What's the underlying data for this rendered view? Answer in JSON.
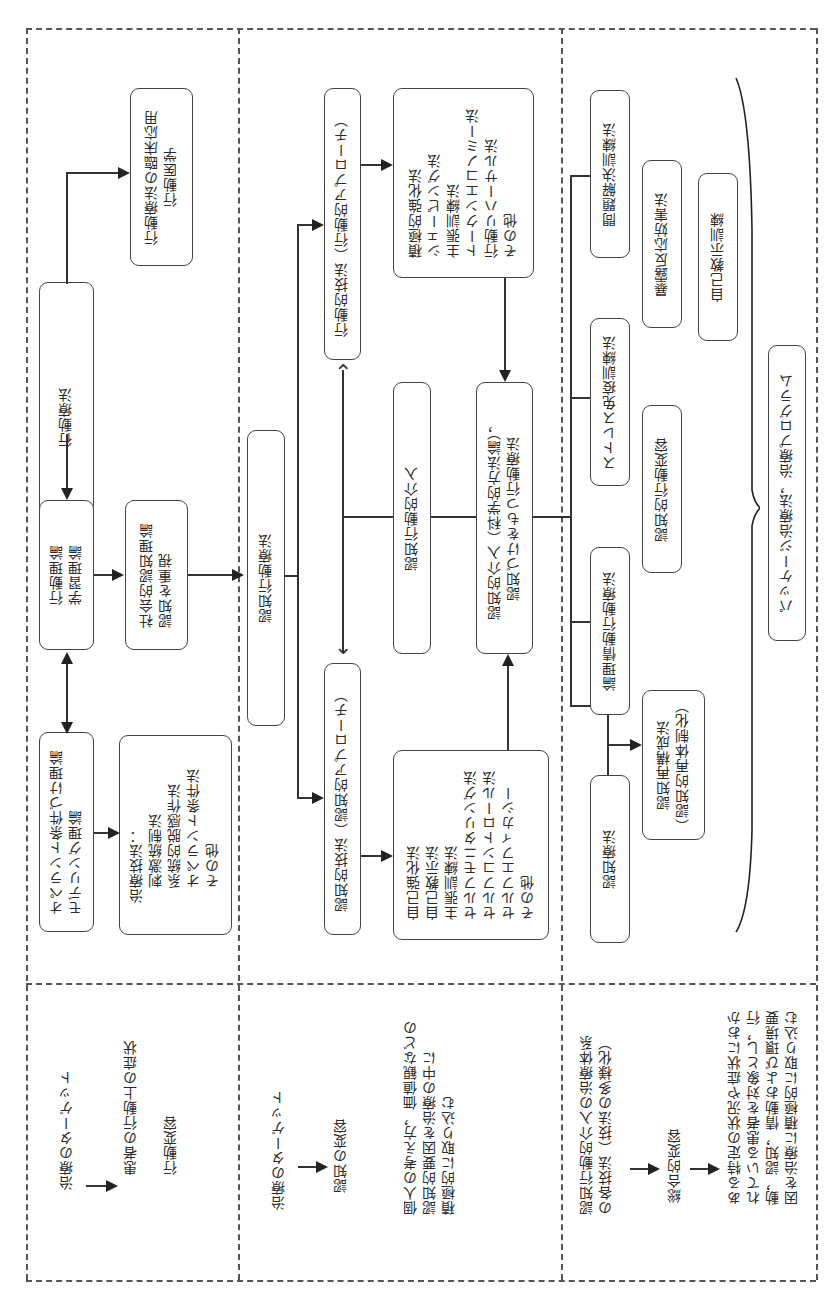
{
  "diagram": {
    "orientation": "rotated-90-ccw",
    "sections": {
      "behavior": {
        "boxes": {
          "behavior_therapy": "行動療法",
          "clinical_application": "行動療法の臨床応用\n行動医学",
          "learning_theory": "行動理論\n学習理論",
          "operant_theory": "オペラント条件づけ理論\nモデリング理論",
          "treatment_techniques": "治療技法：\n　刺激統制法\n　系統的脱感作法\n　オペラント条件法\n　その他",
          "social_cognitive": "社会的認知理論\n認知を重視"
        },
        "note": {
          "target_label": "治療のターゲット",
          "target_value": "患者の行動上の症状",
          "change": "行動変容"
        }
      },
      "cognitive_behavioral": {
        "boxes": {
          "cbt": "認知行動療法",
          "behavioral_technique": "行動的技法（行動的アプローチ）",
          "behavioral_list": "積極的強化法\nシェーピング法\n主張訓練法\nトークンエコノミー法\n行動リハーサル法\nその他",
          "cbt_intervention": "認知行動的介入",
          "cognitive_intervention": "認知的介入（科学的方法論），\n認知づけをもつ行動療法",
          "cognitive_technique": "認知的技法（認知的アプローチ）",
          "cognitive_list": "自己強化法\n自己教示法\n主張訓練法\nセルフモニタリング法\nセルフコントロール法\nセルフエフィカシー\nその他"
        },
        "note": {
          "target_label": "治療のターゲット",
          "target_value": "認知の変容",
          "description": "個人の考え方，価値観などの\n認知的要因を治療の中に\n積極的に取り込む"
        }
      },
      "integrated": {
        "boxes": {
          "problem_solving": "問題解決訓練法",
          "exposure": "暴露反応妨害法",
          "self_instruction": "自己教示訓練",
          "stress_inoculation": "ストレス免疫訓練法",
          "cognitive_behavior_change": "認知的行動変容",
          "rebt": "論理情動行動療法",
          "restructuring": "認知再構成法\n（認知的再体制化）",
          "cognitive_therapy": "認知療法",
          "package": "パッケージ治療法，治療プログラム"
        },
        "note": {
          "line1": "認知行動的介入の治療体系\nの各技法（技法の多様化）",
          "line2": "総合的変容",
          "line3": "ある特定の状況や症状におか\nれている患者を対象とし，行\n動，認知，情動および環境要\n因を治療に積極的に取り込む"
        }
      }
    },
    "colors": {
      "line": "#333333",
      "border": "#444444",
      "background": "#ffffff",
      "text": "#2a2a2a"
    }
  }
}
